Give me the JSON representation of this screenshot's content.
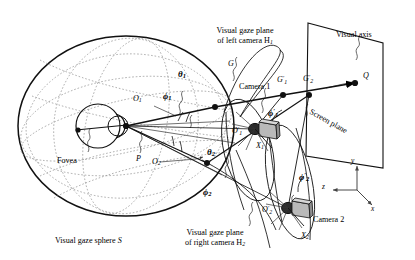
{
  "figure": {
    "type": "technical-diagram",
    "background": "#ffffff",
    "ink": "#000000",
    "dotted_ink": "#9a9a9a",
    "camera_body": "#b9b9b9"
  },
  "labels": {
    "gaze_plane_left_l1": "Visual gaze plane",
    "gaze_plane_left_l2": "of left camera H",
    "gaze_plane_left_sub": "1",
    "gaze_plane_right_l1": "Visual gaze plane",
    "gaze_plane_right_l2": "of right camera H",
    "gaze_plane_right_sub": "2",
    "visual_axis": "Visual axis",
    "screen_plane": "Screen plane",
    "camera1": "Camera 1",
    "camera2": "Camera 2",
    "fovea": "Fovea",
    "sphere_l1": "Visual gaze sphere",
    "sphere_italic": "S",
    "point_P": "P",
    "point_G": "G",
    "point_Q": "Q",
    "point_O1": "O",
    "point_O1_sub": "1",
    "point_O2": "O",
    "point_O2_sub": "2",
    "point_O1p": "O",
    "point_O1p_sup": "′",
    "point_O1p_sub": "1",
    "point_O2p": "O",
    "point_O2p_sup": "′",
    "point_O2p_sub": "2",
    "point_G1p": "G",
    "point_G1p_sup": "′",
    "point_G1p_sub": "1",
    "point_G2p": "G",
    "point_G2p_sup": "′",
    "point_G2p_sub": "2",
    "theta1": "θ",
    "theta1_sub": "1",
    "theta2": "θ",
    "theta2_sub": "2",
    "phi1": "ϕ",
    "phi1_sub": "1",
    "phi2": "ϕ",
    "phi2_sub": "2",
    "phi1p": "ϕ",
    "phi1p_sup": "′",
    "phi1p_sub": "1",
    "phi2p": "ϕ",
    "phi2p_sup": "′",
    "phi2p_sub": "2",
    "axis_x": "x",
    "axis_y": "y",
    "axis_z": "z",
    "chi1": "Χ",
    "chi1_sub": "1",
    "chi2": "Χ",
    "chi2_sub": "2"
  }
}
